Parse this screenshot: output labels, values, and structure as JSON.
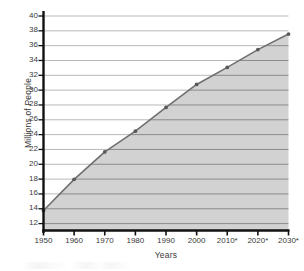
{
  "chart_data": {
    "type": "area",
    "title": "",
    "xlabel": "Years",
    "ylabel": "Millions of People",
    "categories": [
      "1950",
      "1960",
      "1970",
      "1980",
      "1990",
      "2000",
      "2010*",
      "2020*",
      "2030*"
    ],
    "values": [
      13.7,
      17.9,
      21.6,
      24.4,
      27.6,
      30.7,
      33.0,
      35.4,
      37.5
    ],
    "x_numeric": [
      1950,
      1960,
      1970,
      1980,
      1990,
      2000,
      2010,
      2020,
      2030
    ],
    "ylim": [
      11,
      40
    ],
    "yticks": [
      40,
      38,
      36,
      34,
      32,
      30,
      28,
      26,
      24,
      22,
      20,
      18,
      16,
      14,
      12
    ],
    "ytick_labels": [
      "40",
      "38",
      "36",
      "34",
      "32",
      "30",
      "28",
      "26",
      "24",
      "22",
      "20",
      "18",
      "16",
      "14",
      "12"
    ],
    "grid": true,
    "legend": "none",
    "series": [
      {
        "name": "Population",
        "values": [
          13.7,
          17.9,
          21.6,
          24.4,
          27.6,
          30.7,
          33.0,
          35.4,
          37.5
        ],
        "line_color": "#6f6f6f",
        "fill_color": "#d2d2d2",
        "marker": "circle",
        "marker_color": "#5a5a5a"
      }
    ],
    "annotation_note": "Years marked with * are projections",
    "colors": {
      "axis": "#111111",
      "gridline_over_fill": "#8b8b8b",
      "gridline_over_white": "#b9b9b9",
      "plot_fill": "#d2d2d2",
      "data_line": "#6f6f6f",
      "text": "#3a3a3a",
      "background": "#ffffff"
    }
  },
  "axes": {
    "y_title": "Millions of People",
    "x_title": "Years"
  }
}
